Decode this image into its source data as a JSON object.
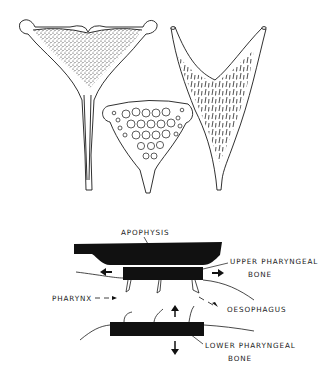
{
  "figure": {
    "top_panel": {
      "description": "Three pharyngeal bone (pharyngeal pad) illustrations",
      "items": [
        {
          "name": "left-pharyngeal-bone",
          "texture": "stippled"
        },
        {
          "name": "middle-pharyngeal-bone",
          "texture": "molariform-teeth"
        },
        {
          "name": "right-pharyngeal-bone",
          "texture": "hooked-teeth"
        }
      ]
    },
    "bottom_panel": {
      "description": "Schematic of pharyngeal jaw mechanism",
      "labels": {
        "apophysis": "APOPHYSIS",
        "upper_bone_line1": "UPPER PHARYNGEAL",
        "upper_bone_line2": "BONE",
        "pharynx": "PHARYNX",
        "oesophagus": "OESOPHAGUS",
        "lower_bone_line1": "LOWER PHARYNGEAL",
        "lower_bone_line2": "BONE"
      },
      "arrows": [
        "left",
        "right",
        "up",
        "down"
      ]
    },
    "colors": {
      "ink": "#1a1a1a",
      "background": "#ffffff"
    }
  }
}
